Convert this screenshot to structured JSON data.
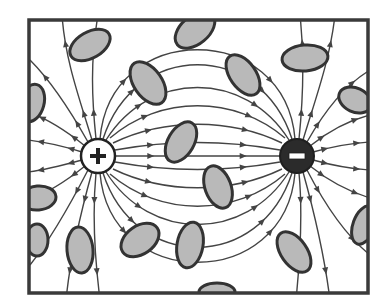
{
  "diagram": {
    "frame": {
      "x": 29,
      "y": 20,
      "width": 339,
      "height": 273,
      "stroke": "#3a3a3a"
    },
    "positive_charge": {
      "cx": 98,
      "cy": 156,
      "r": 17,
      "symbol": "+",
      "fill": "#ffffff"
    },
    "negative_charge": {
      "cx": 297,
      "cy": 156,
      "r": 17,
      "symbol": "−",
      "fill": "#2b2b2b"
    },
    "colors": {
      "line": "#444444",
      "ellipse_fill": "#b9b9b9",
      "ellipse_stroke": "#333333"
    },
    "ellipses": [
      {
        "cx": 90,
        "cy": 45,
        "rx": 22,
        "ry": 13,
        "rot": -30
      },
      {
        "cx": 32,
        "cy": 103,
        "rx": 12,
        "ry": 19,
        "rot": 15
      },
      {
        "cx": 148,
        "cy": 83,
        "rx": 14,
        "ry": 24,
        "rot": -35
      },
      {
        "cx": 195,
        "cy": 30,
        "rx": 14,
        "ry": 23,
        "rot": 50
      },
      {
        "cx": 243,
        "cy": 75,
        "rx": 13,
        "ry": 23,
        "rot": -35
      },
      {
        "cx": 305,
        "cy": 58,
        "rx": 23,
        "ry": 13,
        "rot": -5
      },
      {
        "cx": 355,
        "cy": 100,
        "rx": 17,
        "ry": 12,
        "rot": 25
      },
      {
        "cx": 181,
        "cy": 142,
        "rx": 13,
        "ry": 22,
        "rot": 30
      },
      {
        "cx": 218,
        "cy": 187,
        "rx": 13,
        "ry": 22,
        "rot": -20
      },
      {
        "cx": 38,
        "cy": 198,
        "rx": 18,
        "ry": 12,
        "rot": -5
      },
      {
        "cx": 80,
        "cy": 250,
        "rx": 13,
        "ry": 23,
        "rot": -5
      },
      {
        "cx": 140,
        "cy": 240,
        "rx": 21,
        "ry": 14,
        "rot": -35
      },
      {
        "cx": 190,
        "cy": 245,
        "rx": 13,
        "ry": 23,
        "rot": 10
      },
      {
        "cx": 37,
        "cy": 240,
        "rx": 11,
        "ry": 16,
        "rot": 0
      },
      {
        "cx": 294,
        "cy": 252,
        "rx": 13,
        "ry": 23,
        "rot": -35
      },
      {
        "cx": 364,
        "cy": 225,
        "rx": 11,
        "ry": 20,
        "rot": 20
      },
      {
        "cx": 217,
        "cy": 292,
        "rx": 18,
        "ry": 9,
        "rot": 0
      }
    ]
  }
}
